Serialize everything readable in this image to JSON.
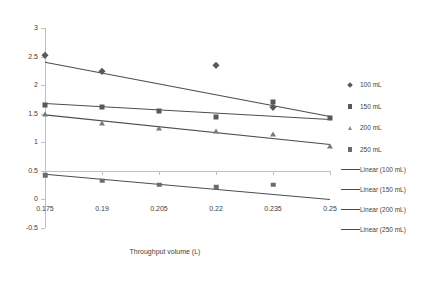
{
  "chart_data": {
    "type": "scatter",
    "title": "",
    "xlabel": "Throughput volume (L)",
    "ylabel": "Ln ( Co/Ct -1)",
    "xlim": [
      0.175,
      0.25
    ],
    "ylim": [
      -0.5,
      3
    ],
    "xticks": [
      "0.175",
      "0.19",
      "0.205",
      "0.22",
      "0.235",
      "0.25"
    ],
    "xtick_values": [
      0.175,
      0.19,
      0.205,
      0.22,
      0.235,
      0.25
    ],
    "yticks": [
      "-0.5",
      "0",
      "0.5",
      "1",
      "1.5",
      "2",
      "2.5",
      "3"
    ],
    "ytick_values": [
      -0.5,
      0,
      0.5,
      1,
      1.5,
      2,
      2.5,
      3
    ],
    "grid": false,
    "legend_position": "right",
    "series": [
      {
        "name": "100 mL",
        "marker": "diamond",
        "color": "#595959",
        "x": [
          0.175,
          0.19,
          0.22,
          0.235
        ],
        "y": [
          2.52,
          2.24,
          2.35,
          1.62
        ]
      },
      {
        "name": "150 mL",
        "marker": "square",
        "color": "#595959",
        "x": [
          0.175,
          0.19,
          0.205,
          0.22,
          0.235,
          0.25
        ],
        "y": [
          1.65,
          1.62,
          1.54,
          1.44,
          1.7,
          1.42
        ]
      },
      {
        "name": "200 mL",
        "marker": "triangle",
        "color": "#7a7a7a",
        "x": [
          0.175,
          0.19,
          0.205,
          0.22,
          0.235,
          0.25
        ],
        "y": [
          1.5,
          1.33,
          1.25,
          1.2,
          1.15,
          0.93
        ]
      },
      {
        "name": "250 mL",
        "marker": "square",
        "color": "#6b6b6b",
        "x": [
          0.175,
          0.19,
          0.205,
          0.22,
          0.235
        ],
        "y": [
          0.42,
          0.33,
          0.26,
          0.21,
          0.26
        ]
      }
    ],
    "trendlines": [
      {
        "name": "Linear (100 mL)",
        "x0": 0.175,
        "y0": 2.4,
        "x1": 0.25,
        "y1": 1.45
      },
      {
        "name": "Linear (150 mL)",
        "x0": 0.175,
        "y0": 1.68,
        "x1": 0.25,
        "y1": 1.4
      },
      {
        "name": "Linear (200 mL)",
        "x0": 0.175,
        "y0": 1.48,
        "x1": 0.25,
        "y1": 0.96
      },
      {
        "name": "Linear (250 mL)",
        "x0": 0.175,
        "y0": 0.44,
        "x1": 0.25,
        "y1": 0.0
      }
    ]
  },
  "legend": {
    "entries": [
      {
        "label": "100 mL",
        "key": "diamond-marker"
      },
      {
        "label": "150 mL",
        "key": "square-marker"
      },
      {
        "label": "200 mL",
        "key": "triangle-marker"
      },
      {
        "label": "250 mL",
        "key": "square-marker"
      },
      {
        "label": "Linear (100 mL)",
        "key": "line-swatch"
      },
      {
        "label": "Linear (150 mL)",
        "key": "line-swatch"
      },
      {
        "label": "Linear (200 mL)",
        "key": "line-swatch"
      },
      {
        "label": "Linear (250 mL)",
        "key": "line-swatch"
      }
    ]
  }
}
